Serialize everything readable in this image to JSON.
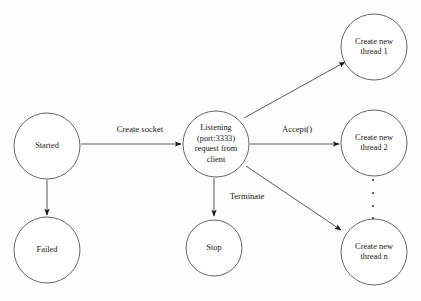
{
  "diagram": {
    "type": "state-diagram",
    "canvas": {
      "width": 421,
      "height": 301
    },
    "colors": {
      "background": "#fdfdfd",
      "node_stroke": "#55555a",
      "node_fill": "#ffffff",
      "edge_stroke": "#5a5a60",
      "arrow_fill": "#1a1a1a",
      "text": "#17171a"
    },
    "nodes": [
      {
        "id": "started",
        "shape": "circle",
        "cx": 47,
        "cy": 146,
        "r": 33,
        "lines": [
          "Started"
        ]
      },
      {
        "id": "failed",
        "shape": "circle",
        "cx": 47,
        "cy": 250,
        "r": 33,
        "lines": [
          "Failed"
        ]
      },
      {
        "id": "listening",
        "shape": "circle",
        "cx": 216,
        "cy": 144,
        "r": 33,
        "lines": [
          "Listening",
          "(port:3333)",
          "request from",
          "client"
        ]
      },
      {
        "id": "stop",
        "shape": "circle",
        "cx": 214,
        "cy": 248,
        "r": 28,
        "lines": [
          "Stop"
        ]
      },
      {
        "id": "thread1",
        "shape": "circle",
        "cx": 374,
        "cy": 47,
        "r": 33,
        "lines": [
          "Create new",
          "thread 1"
        ]
      },
      {
        "id": "thread2",
        "shape": "circle",
        "cx": 374,
        "cy": 143,
        "r": 33,
        "lines": [
          "Create new",
          "thread 2"
        ]
      },
      {
        "id": "threadn",
        "shape": "circle",
        "cx": 374,
        "cy": 252,
        "r": 33,
        "lines": [
          "Create new",
          "thread n"
        ]
      }
    ],
    "edges": [
      {
        "id": "started-to-listening",
        "from": "started",
        "to": "listening",
        "label": "Create socket",
        "label_x": 140,
        "label_y": 130,
        "x1": 81,
        "y1": 144,
        "x2": 181,
        "y2": 144
      },
      {
        "id": "started-to-failed",
        "from": "started",
        "to": "failed",
        "label": "",
        "x1": 47,
        "y1": 180,
        "x2": 47,
        "y2": 215
      },
      {
        "id": "listening-to-thread2",
        "from": "listening",
        "to": "thread2",
        "label": "Accept()",
        "label_x": 297,
        "label_y": 130,
        "x1": 250,
        "y1": 144,
        "x2": 339,
        "y2": 144
      },
      {
        "id": "listening-to-thread1",
        "from": "listening",
        "to": "thread1",
        "label": "",
        "x1": 244,
        "y1": 118,
        "x2": 345,
        "y2": 62
      },
      {
        "id": "listening-to-threadn",
        "from": "listening",
        "to": "threadn",
        "label": "",
        "x1": 246,
        "y1": 166,
        "x2": 341,
        "y2": 230
      },
      {
        "id": "listening-to-stop",
        "from": "listening",
        "to": "stop",
        "label": "Terminate",
        "label_x": 247,
        "label_y": 197,
        "x1": 214,
        "y1": 178,
        "x2": 214,
        "y2": 216
      }
    ],
    "ellipsis": {
      "id": "thread-series-ellipsis",
      "x": 373,
      "dots": [
        180,
        193,
        206,
        218
      ],
      "radius": 1.1
    }
  }
}
